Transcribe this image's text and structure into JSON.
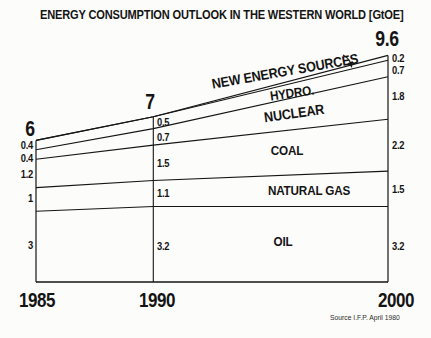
{
  "title": "ENERGY CONSUMPTION OUTLOOK IN THE WESTERN WORLD [GtOE]",
  "source_note": "Source I.F.P. April 1980",
  "chart_data": {
    "type": "area",
    "stacked": true,
    "title": "ENERGY CONSUMPTION OUTLOOK IN THE WESTERN WORLD [GtOE]",
    "unit": "GtOE",
    "x": [
      1985,
      1990,
      2000
    ],
    "x_tick_labels": [
      "1985",
      "1990",
      "2000"
    ],
    "ylim": [
      0,
      10
    ],
    "grid": false,
    "legend_position": "in-band-labels",
    "series": [
      {
        "name": "OIL",
        "values": [
          3,
          3.2,
          3.2
        ],
        "labels": [
          "3",
          "3.2",
          "3.2"
        ]
      },
      {
        "name": "NATURAL GAS",
        "values": [
          1,
          1.1,
          1.5
        ],
        "labels": [
          "1",
          "1.1",
          "1.5"
        ]
      },
      {
        "name": "COAL",
        "values": [
          1.2,
          1.5,
          2.2
        ],
        "labels": [
          "1.2",
          "1.5",
          "2.2"
        ]
      },
      {
        "name": "NUCLEAR",
        "values": [
          0.4,
          0.7,
          1.8
        ],
        "labels": [
          "0.4",
          "0.7",
          "1.8"
        ]
      },
      {
        "name": "HYDRO.",
        "values": [
          0.4,
          0.5,
          0.7
        ],
        "labels": [
          "0.4",
          "0.5",
          "0.7"
        ]
      },
      {
        "name": "NEW ENERGY SOURCES",
        "values": [
          0,
          0,
          0.2
        ],
        "labels": [
          null,
          null,
          "0.2"
        ]
      }
    ],
    "totals": {
      "values": [
        6,
        7,
        9.6
      ],
      "labels": [
        "6",
        "7",
        "9.6"
      ]
    },
    "line_color": "#151515",
    "background_color": "#fcfcfa"
  }
}
